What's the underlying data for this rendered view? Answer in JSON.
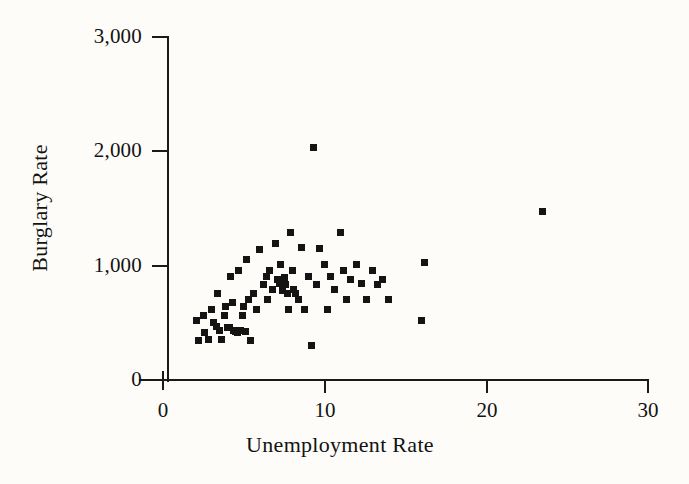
{
  "chart_data": {
    "type": "scatter",
    "title": "",
    "xlabel": "Unemployment Rate",
    "ylabel": "Burglary Rate",
    "xlim": [
      0,
      30
    ],
    "ylim": [
      0,
      3000
    ],
    "xticks": [
      0,
      10,
      20,
      30
    ],
    "yticks": [
      0,
      1000,
      2000,
      3000
    ],
    "xtick_labels": [
      "0",
      "10",
      "20",
      "30"
    ],
    "ytick_labels": [
      "0",
      "1,000",
      "2,000",
      "3,000"
    ],
    "grid": false,
    "legend": null,
    "marker": "square",
    "marker_color": "#141414",
    "points": [
      [
        2.1,
        520
      ],
      [
        2.2,
        345
      ],
      [
        2.5,
        560
      ],
      [
        2.6,
        415
      ],
      [
        2.8,
        350
      ],
      [
        3.0,
        615
      ],
      [
        3.1,
        500
      ],
      [
        3.3,
        470
      ],
      [
        3.4,
        755
      ],
      [
        3.5,
        430
      ],
      [
        3.6,
        350
      ],
      [
        3.8,
        560
      ],
      [
        3.9,
        640
      ],
      [
        4.0,
        460
      ],
      [
        4.1,
        455
      ],
      [
        4.2,
        905
      ],
      [
        4.3,
        680
      ],
      [
        4.4,
        430
      ],
      [
        4.5,
        420
      ],
      [
        4.6,
        415
      ],
      [
        4.7,
        960
      ],
      [
        4.8,
        430
      ],
      [
        4.9,
        560
      ],
      [
        5.0,
        640
      ],
      [
        5.1,
        420
      ],
      [
        5.2,
        1055
      ],
      [
        5.3,
        700
      ],
      [
        5.4,
        345
      ],
      [
        5.6,
        760
      ],
      [
        5.8,
        620
      ],
      [
        6.0,
        1140
      ],
      [
        6.2,
        835
      ],
      [
        6.4,
        905
      ],
      [
        6.5,
        700
      ],
      [
        6.6,
        960
      ],
      [
        6.8,
        790
      ],
      [
        7.0,
        1195
      ],
      [
        7.1,
        880
      ],
      [
        7.2,
        845
      ],
      [
        7.3,
        1010
      ],
      [
        7.4,
        780
      ],
      [
        7.5,
        900
      ],
      [
        7.6,
        835
      ],
      [
        7.7,
        755
      ],
      [
        7.8,
        620
      ],
      [
        7.9,
        1290
      ],
      [
        8.0,
        960
      ],
      [
        8.1,
        790
      ],
      [
        8.2,
        755
      ],
      [
        8.4,
        700
      ],
      [
        8.6,
        1160
      ],
      [
        8.8,
        620
      ],
      [
        9.0,
        905
      ],
      [
        9.2,
        300
      ],
      [
        9.3,
        2030
      ],
      [
        9.5,
        835
      ],
      [
        9.7,
        1150
      ],
      [
        10.0,
        1010
      ],
      [
        10.2,
        620
      ],
      [
        10.4,
        905
      ],
      [
        10.6,
        790
      ],
      [
        11.0,
        1290
      ],
      [
        11.2,
        960
      ],
      [
        11.4,
        700
      ],
      [
        11.6,
        880
      ],
      [
        12.0,
        1010
      ],
      [
        12.3,
        845
      ],
      [
        12.6,
        700
      ],
      [
        13.0,
        960
      ],
      [
        13.3,
        835
      ],
      [
        13.6,
        880
      ],
      [
        14.0,
        700
      ],
      [
        16.0,
        520
      ],
      [
        16.2,
        1030
      ],
      [
        23.5,
        1470
      ]
    ],
    "n_points": 75
  },
  "axes": {
    "y_axis_name": "y-axis",
    "x_axis_name": "x-axis"
  }
}
